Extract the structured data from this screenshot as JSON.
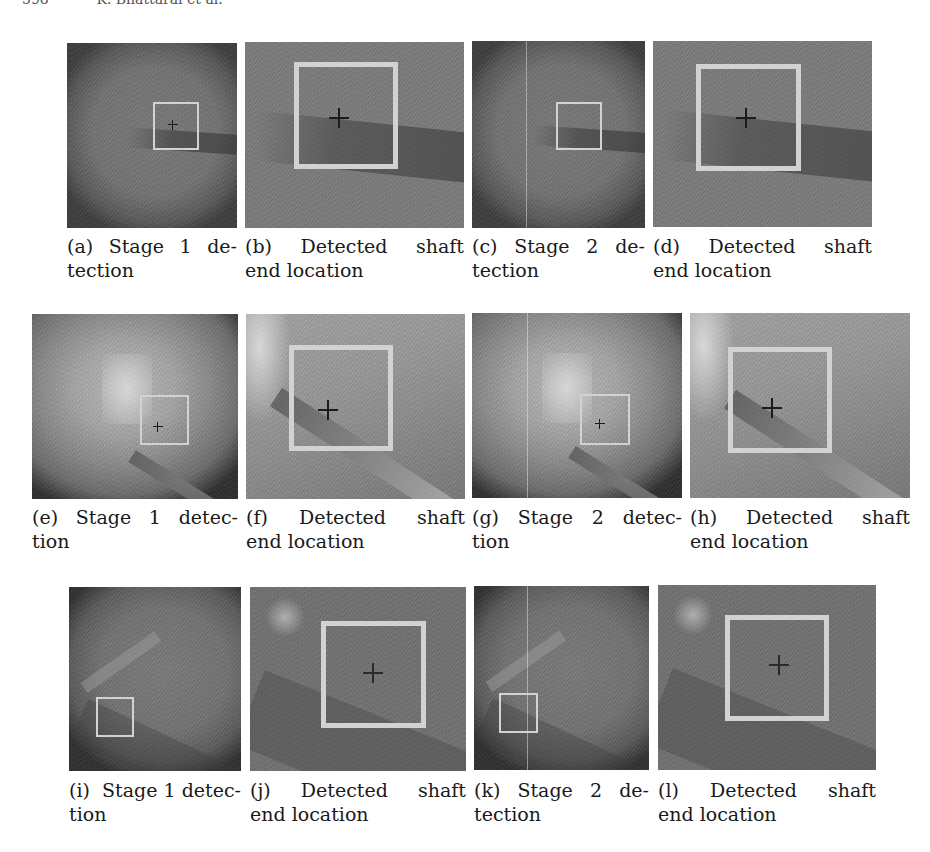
{
  "header": {
    "page_number": "598",
    "running_head": "K. Bhattarai et al."
  },
  "figure": {
    "panels": [
      {
        "id": "a",
        "label": "(a)",
        "caption_line1": [
          "(a)",
          "Stage",
          "1",
          "de-"
        ],
        "caption_line2": "tection",
        "type": "stage1"
      },
      {
        "id": "b",
        "label": "(b)",
        "caption_line1": [
          "(b)",
          "Detected",
          "shaft"
        ],
        "caption_line2": "end location",
        "type": "zoom"
      },
      {
        "id": "c",
        "label": "(c)",
        "caption_line1": [
          "(c)",
          "Stage",
          "2",
          "de-"
        ],
        "caption_line2": "tection",
        "type": "stage2"
      },
      {
        "id": "d",
        "label": "(d)",
        "caption_line1": [
          "(d)",
          "Detected",
          "shaft"
        ],
        "caption_line2": "end location",
        "type": "zoom"
      },
      {
        "id": "e",
        "label": "(e)",
        "caption_line1": [
          "(e)",
          "Stage",
          "1",
          "detec-"
        ],
        "caption_line2": "tion",
        "type": "stage1"
      },
      {
        "id": "f",
        "label": "(f)",
        "caption_line1": [
          "(f)",
          "Detected",
          "shaft"
        ],
        "caption_line2": "end location",
        "type": "zoom"
      },
      {
        "id": "g",
        "label": "(g)",
        "caption_line1": [
          "(g)",
          "Stage",
          "2",
          "detec-"
        ],
        "caption_line2": "tion",
        "type": "stage2"
      },
      {
        "id": "h",
        "label": "(h)",
        "caption_line1": [
          "(h)",
          "Detected",
          "shaft"
        ],
        "caption_line2": "end location",
        "type": "zoom"
      },
      {
        "id": "i",
        "label": "(i)",
        "caption_line1": [
          "(i)",
          "Stage 1 detec-"
        ],
        "caption_line2": "tion",
        "type": "stage1"
      },
      {
        "id": "j",
        "label": "(j)",
        "caption_line1": [
          "(j)",
          "Detected",
          "shaft"
        ],
        "caption_line2": "end location",
        "type": "zoom"
      },
      {
        "id": "k",
        "label": "(k)",
        "caption_line1": [
          "(k)",
          "Stage",
          "2",
          "de-"
        ],
        "caption_line2": "tection",
        "type": "stage2"
      },
      {
        "id": "l",
        "label": "(l)",
        "caption_line1": [
          "(l)",
          "Detected",
          "shaft"
        ],
        "caption_line2": "end location",
        "type": "zoom"
      }
    ]
  }
}
